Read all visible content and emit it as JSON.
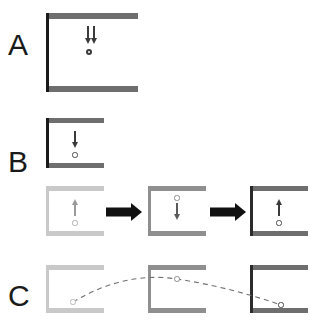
{
  "figure": {
    "type": "scientific-diagram",
    "background": "#ffffff",
    "width": 317,
    "height": 324
  },
  "colors": {
    "dark_gray": "#6e6e6e",
    "mid_gray": "#8f8f8f",
    "light_gray": "#c9c9c9",
    "very_light_gray": "#d8d8d8",
    "black": "#1a1a1a",
    "arrow_black": "#111111",
    "ball_stroke": "#555555",
    "ball_fill": "#ffffff",
    "dash_stroke": "#707070"
  },
  "panels": [
    {
      "id": "A",
      "label": "A",
      "label_x": 8,
      "label_y": 30,
      "cells": [
        {
          "name": "frame-a",
          "x": 46,
          "y": 13,
          "width": 92,
          "height": 79,
          "tone": "dark_gray",
          "beam_thickness": 6,
          "column_thickness": 3,
          "arrows": [
            {
              "direction": "down",
              "x": 86,
              "y": 26,
              "length": 18
            },
            {
              "direction": "down",
              "x": 92,
              "y": 26,
              "length": 18
            }
          ],
          "ball": {
            "x": 89,
            "y": 52,
            "radius": 3.2
          }
        }
      ]
    },
    {
      "id": "B",
      "label": "B",
      "label_x": 8,
      "label_y": 147,
      "rows": [
        {
          "name": "row-b1",
          "cells": [
            {
              "name": "frame-b1",
              "x": 46,
              "y": 118,
              "width": 58,
              "height": 50,
              "tone": "dark_gray",
              "beam_thickness": 5,
              "column_thickness": 3,
              "arrows": [
                {
                  "direction": "down",
                  "x": 75,
                  "y": 131,
                  "length": 17
                }
              ],
              "ball": {
                "x": 75,
                "y": 155,
                "radius": 2.6
              }
            }
          ]
        },
        {
          "name": "row-b2",
          "cells": [
            {
              "name": "frame-b2-1",
              "x": 46,
              "y": 186,
              "width": 58,
              "height": 50,
              "tone": "light_gray",
              "beam_thickness": 5,
              "column_thickness": 3,
              "arrows": [
                {
                  "direction": "up",
                  "x": 75,
                  "y": 199,
                  "length": 17
                }
              ],
              "ball": {
                "x": 75,
                "y": 223,
                "radius": 2.6
              }
            },
            {
              "name": "frame-b2-2",
              "x": 148,
              "y": 186,
              "width": 58,
              "height": 50,
              "tone": "mid_gray",
              "beam_thickness": 5,
              "column_thickness": 3,
              "arrows": [
                {
                  "direction": "down",
                  "x": 177,
                  "y": 203,
                  "length": 17
                }
              ],
              "ball": {
                "x": 177,
                "y": 198,
                "radius": 2.6
              }
            },
            {
              "name": "frame-b2-3",
              "x": 250,
              "y": 186,
              "width": 58,
              "height": 50,
              "tone": "dark_gray",
              "beam_thickness": 5,
              "column_thickness": 3,
              "arrows": [
                {
                  "direction": "up",
                  "x": 279,
                  "y": 199,
                  "length": 17
                }
              ],
              "ball": {
                "x": 279,
                "y": 223,
                "radius": 2.6
              }
            }
          ],
          "transition_arrows": [
            {
              "name": "transition-arrow-1",
              "x": 106,
              "y": 203,
              "width": 36,
              "height": 18
            },
            {
              "name": "transition-arrow-2",
              "x": 210,
              "y": 203,
              "width": 36,
              "height": 18
            }
          ]
        }
      ]
    },
    {
      "id": "C",
      "label": "C",
      "label_x": 8,
      "label_y": 281,
      "cells": [
        {
          "name": "frame-c-1",
          "x": 46,
          "y": 265,
          "width": 58,
          "height": 48,
          "tone": "light_gray",
          "beam_thickness": 5,
          "column_thickness": 3,
          "ball": {
            "x": 73,
            "y": 302,
            "radius": 2.6
          }
        },
        {
          "name": "frame-c-2",
          "x": 148,
          "y": 265,
          "width": 58,
          "height": 48,
          "tone": "mid_gray",
          "beam_thickness": 5,
          "column_thickness": 3,
          "ball": {
            "x": 177,
            "y": 279,
            "radius": 2.8
          }
        },
        {
          "name": "frame-c-3",
          "x": 250,
          "y": 265,
          "width": 58,
          "height": 48,
          "tone": "dark_gray",
          "beam_thickness": 5,
          "column_thickness": 3,
          "ball": {
            "x": 281,
            "y": 305,
            "radius": 2.6
          }
        }
      ],
      "trajectory": {
        "name": "ball-trajectory-path",
        "style": "dashed",
        "dash_pattern": "5 4",
        "stroke_width": 1.1,
        "points": [
          {
            "x": 73,
            "y": 302
          },
          {
            "x": 177,
            "y": 279
          },
          {
            "x": 281,
            "y": 305
          }
        ]
      }
    }
  ]
}
